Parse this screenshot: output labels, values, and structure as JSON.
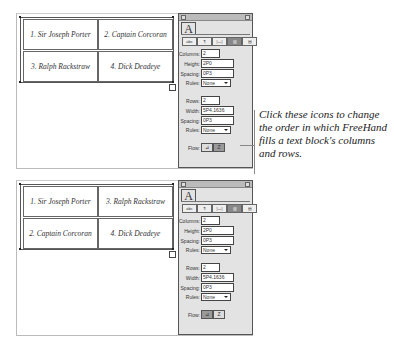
{
  "top": {
    "cells": [
      "1. Sir Joseph Porter",
      "2. Captain Corcoran",
      "3. Ralph Rackstraw",
      "4. Dick Deadeye"
    ],
    "panel": {
      "tab": "A",
      "icons": [
        "abc",
        "¶",
        "|↔|",
        "▥",
        "▤"
      ],
      "columns": {
        "label": "Columns:",
        "value": "2"
      },
      "height": {
        "label": "Height:",
        "value": "2P0"
      },
      "col_spacing": {
        "label": "Spacing:",
        "value": "0P3"
      },
      "col_rules": {
        "label": "Rules:",
        "value": "None"
      },
      "rows": {
        "label": "Rows:",
        "value": "2"
      },
      "width": {
        "label": "Width:",
        "value": "5P4.1636"
      },
      "row_spacing": {
        "label": "Spacing:",
        "value": "0P3"
      },
      "row_rules": {
        "label": "Rules:",
        "value": "None"
      },
      "flow": {
        "label": "Flow:",
        "btn1": "⊿",
        "btn2": "Z"
      }
    }
  },
  "bottom": {
    "cells": [
      "1. Sir Joseph Porter",
      "3. Ralph Rackstraw",
      "2. Captain Corcoran",
      "4. Dick Deadeye"
    ],
    "panel": {
      "tab": "A",
      "icons": [
        "abc",
        "¶",
        "|↔|",
        "▥",
        "▤"
      ],
      "columns": {
        "label": "Columns:",
        "value": "2"
      },
      "height": {
        "label": "Height:",
        "value": "2P0"
      },
      "col_spacing": {
        "label": "Spacing:",
        "value": "0P3"
      },
      "col_rules": {
        "label": "Rules:",
        "value": "None"
      },
      "rows": {
        "label": "Rows:",
        "value": "2"
      },
      "width": {
        "label": "Width:",
        "value": "5P4.1636"
      },
      "row_spacing": {
        "label": "Spacing:",
        "value": "0P3"
      },
      "row_rules": {
        "label": "Rules:",
        "value": "None"
      },
      "flow": {
        "label": "Flow:",
        "btn1": "⊿",
        "btn2": "Z"
      }
    }
  },
  "caption": "Click these icons to change the order in which FreeHand fills a text block's columns and rows."
}
